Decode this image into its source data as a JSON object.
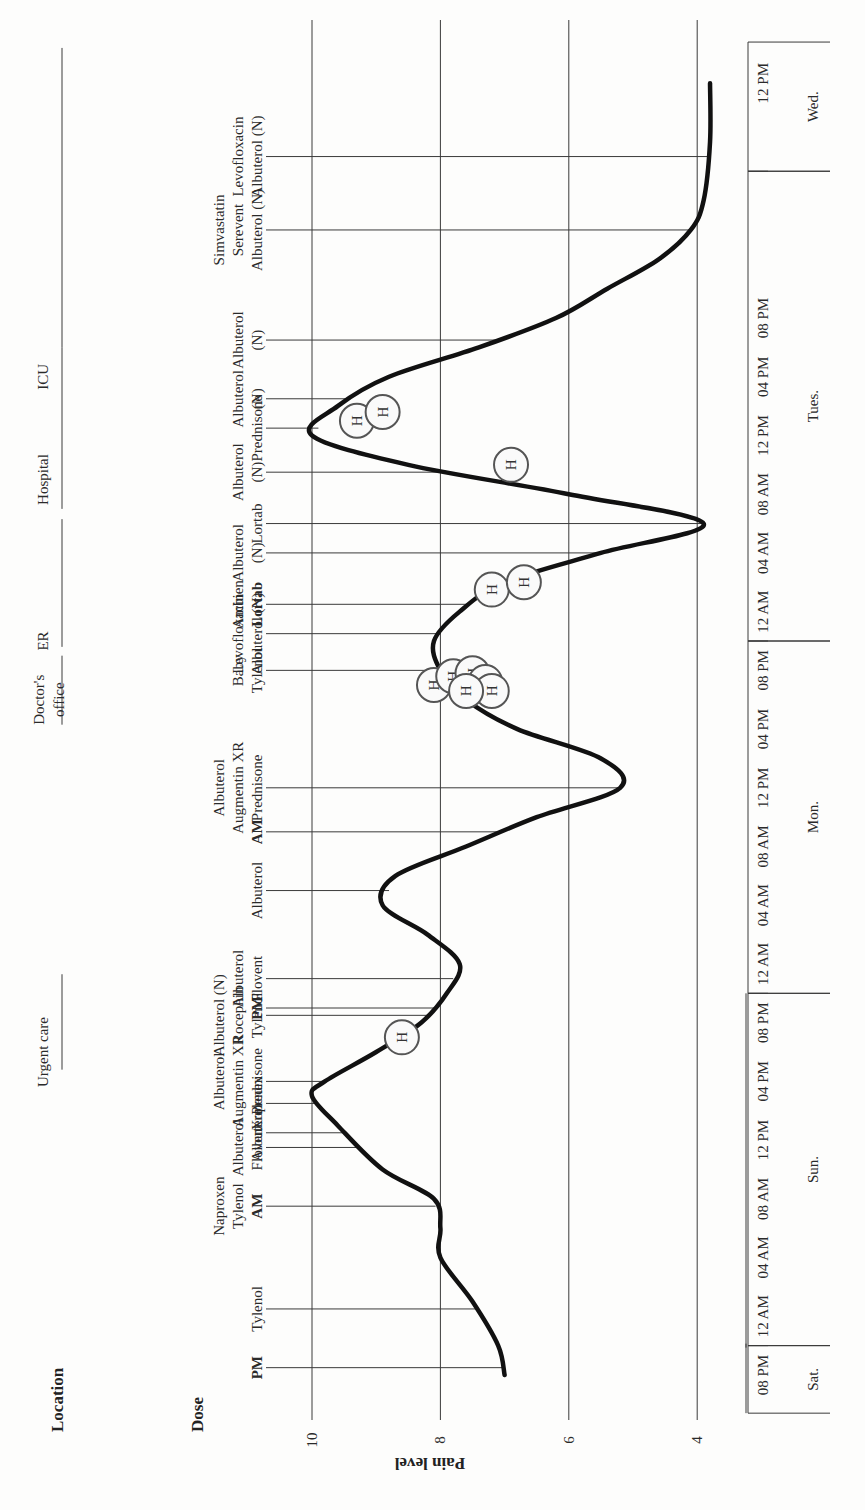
{
  "headers": {
    "location": "Location",
    "dose": "Dose",
    "y_axis_label": "Pain level"
  },
  "chart_data": {
    "type": "line",
    "title": "",
    "orientation": "rotated-90 (time axis runs bottom to top, pain axis left to right)",
    "xlabel": "Time",
    "ylabel": "Pain level",
    "ylim": [
      3.5,
      10.5
    ],
    "y_ticks": [
      10,
      8,
      6,
      4
    ],
    "grid": true,
    "x_ticks": [
      "08 PM",
      "12 AM",
      "04 AM",
      "08 AM",
      "12 PM",
      "04 PM",
      "08 PM",
      "12 AM",
      "04 AM",
      "08 AM",
      "12 PM",
      "04 PM",
      "08 PM",
      "12 AM",
      "04 AM",
      "08 AM",
      "12 PM",
      "04 PM",
      "08 PM",
      "12 PM"
    ],
    "days": [
      {
        "label": "Sat.",
        "span": "08 PM"
      },
      {
        "label": "Sun.",
        "span": "12 AM – 08 PM"
      },
      {
        "label": "Mon.",
        "span": "12 AM – 08 PM"
      },
      {
        "label": "Tues.",
        "span": "12 AM – 08 PM"
      },
      {
        "label": "Wed.",
        "span": "12 PM"
      }
    ],
    "series": [
      {
        "name": "Pain level",
        "hours_from_sat_8pm": [
          0,
          2,
          5,
          8,
          10,
          12,
          14,
          17,
          19,
          20,
          22,
          24,
          26,
          28,
          30,
          32,
          34,
          36,
          38,
          40,
          42,
          44,
          46,
          48,
          50,
          52,
          54,
          56,
          58,
          60,
          62,
          64,
          66,
          68,
          70,
          72,
          74,
          76,
          78,
          80,
          84,
          88
        ],
        "values": [
          7.0,
          7.1,
          7.5,
          8.0,
          8.0,
          8.1,
          8.9,
          9.6,
          10.0,
          9.8,
          9.0,
          8.3,
          7.9,
          7.7,
          8.2,
          8.9,
          8.7,
          7.6,
          6.5,
          5.2,
          5.5,
          6.8,
          7.6,
          8.0,
          8.1,
          7.7,
          7.0,
          5.5,
          3.9,
          6.0,
          8.5,
          10.0,
          9.6,
          8.8,
          7.4,
          6.2,
          5.4,
          4.6,
          4.1,
          3.9,
          3.8,
          3.8
        ]
      }
    ],
    "hospital_markers": [
      {
        "hours": 23,
        "value": 8.6
      },
      {
        "hours": 47,
        "value": 8.1
      },
      {
        "hours": 47.6,
        "value": 7.8
      },
      {
        "hours": 47.8,
        "value": 7.5
      },
      {
        "hours": 47.2,
        "value": 7.3
      },
      {
        "hours": 46.6,
        "value": 7.2
      },
      {
        "hours": 46.6,
        "value": 7.6
      },
      {
        "hours": 53.5,
        "value": 7.2
      },
      {
        "hours": 54,
        "value": 6.7
      },
      {
        "hours": 62,
        "value": 6.9
      },
      {
        "hours": 65,
        "value": 9.3
      },
      {
        "hours": 65.6,
        "value": 8.9
      }
    ],
    "hospital_marker_label": "H",
    "locations": [
      {
        "label": "Urgent care",
        "hours": 22
      },
      {
        "label": "Doctor's office",
        "hours": 46
      },
      {
        "label": "ER",
        "hours": 50
      },
      {
        "label": "Hospital",
        "hours": 61
      },
      {
        "label": "ICU",
        "hours": 68
      }
    ],
    "doses": [
      {
        "hours": 0.5,
        "lines": [
          "PM"
        ],
        "bold": [
          true
        ],
        "label": "PM"
      },
      {
        "hours": 4.5,
        "lines": [
          "Tylenol"
        ],
        "bold": [
          false
        ]
      },
      {
        "hours": 11.5,
        "lines": [
          "Naproxen",
          "Tylenol",
          "AM"
        ],
        "bold": [
          false,
          false,
          true
        ]
      },
      {
        "hours": 15.5,
        "lines": [
          "Albuterol",
          "Flovent"
        ],
        "bold": [
          false,
          false
        ]
      },
      {
        "hours": 16.5,
        "lines": [
          "Albuterol"
        ],
        "bold": [
          false
        ]
      },
      {
        "hours": 18.5,
        "lines": [
          "Xopenex"
        ],
        "bold": [
          false
        ]
      },
      {
        "hours": 20,
        "lines": [
          "Albuterol",
          "Augmentin XR",
          "Prednisone"
        ],
        "bold": [
          false,
          false,
          false
        ]
      },
      {
        "hours": 24.5,
        "lines": [
          "Albuterol (N)",
          "Rocephin",
          "Tylenol"
        ],
        "bold": [
          false,
          false,
          false
        ]
      },
      {
        "hours": 25,
        "lines": [
          "PM"
        ],
        "bold": [
          true
        ]
      },
      {
        "hours": 27,
        "lines": [
          "Albuterol",
          "Flovent"
        ],
        "bold": [
          false,
          false
        ]
      },
      {
        "hours": 33,
        "lines": [
          "Albuterol"
        ],
        "bold": [
          false
        ]
      },
      {
        "hours": 37,
        "lines": [
          "AM"
        ],
        "bold": [
          true
        ]
      },
      {
        "hours": 40,
        "lines": [
          "Albuterol",
          "Augmentin XR",
          "Prednisone"
        ],
        "bold": [
          false,
          false,
          false
        ]
      },
      {
        "hours": 48,
        "lines": [
          "Baby",
          "Tylenol"
        ],
        "bold": [
          false,
          false
        ]
      },
      {
        "hours": 50.5,
        "lines": [
          "Levofloxacin",
          "Albuterol (N)"
        ],
        "bold": [
          false,
          false
        ]
      },
      {
        "hours": 52.5,
        "lines": [
          "Ambien",
          "Lortab"
        ],
        "bold": [
          false,
          true
        ]
      },
      {
        "hours": 56,
        "lines": [
          "Albuterol",
          "(N)"
        ],
        "bold": [
          false,
          false
        ]
      },
      {
        "hours": 58,
        "lines": [
          "Lortab"
        ],
        "bold": [
          false
        ]
      },
      {
        "hours": 61.5,
        "lines": [
          "Albuterol",
          "(N)"
        ],
        "bold": [
          false,
          false
        ]
      },
      {
        "hours": 64.5,
        "lines": [
          "Prednisone"
        ],
        "bold": [
          false
        ]
      },
      {
        "hours": 66.5,
        "lines": [
          "Albuterol",
          "(N)"
        ],
        "bold": [
          false,
          false
        ]
      },
      {
        "hours": 70.5,
        "lines": [
          "Albuterol",
          "(N)"
        ],
        "bold": [
          false,
          false
        ]
      },
      {
        "hours": 78,
        "lines": [
          "Simvastatin",
          "Serevent",
          "Albuterol (N)"
        ],
        "bold": [
          false,
          false,
          false
        ]
      },
      {
        "hours": 83,
        "lines": [
          "Levofloxacin",
          "Albuterol (N)"
        ],
        "bold": [
          false,
          false
        ]
      }
    ],
    "legend": null
  }
}
